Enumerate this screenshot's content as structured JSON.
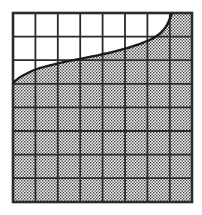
{
  "figure": {
    "canvas": {
      "width": 202,
      "height": 215,
      "background": "#ffffff"
    },
    "plot_box": {
      "x0": 13,
      "y0": 13,
      "x1": 192,
      "y1": 202
    },
    "grid": {
      "columns": 8,
      "rows": 8,
      "line_color": "#2b2b2b",
      "inner_line_width": 1.8,
      "border_line_width": 2.6,
      "x_lines": [
        13,
        35.4,
        57.8,
        80.2,
        102.6,
        125.0,
        147.4,
        169.8,
        192
      ],
      "y_lines": [
        13,
        36.6,
        60.2,
        83.8,
        107.4,
        131.0,
        154.6,
        178.2,
        202
      ]
    },
    "curve": {
      "name": "boundary-curve",
      "color": "#1a1a1a",
      "line_width": 2.4,
      "shape": "increasing-concave",
      "start_point": [
        13,
        83
      ],
      "end_point": [
        172,
        13
      ],
      "points": [
        [
          13,
          83.0
        ],
        [
          22,
          76.0
        ],
        [
          33,
          70.5
        ],
        [
          45,
          66.6
        ],
        [
          58,
          63.4
        ],
        [
          72,
          60.4
        ],
        [
          86,
          57.6
        ],
        [
          100,
          54.8
        ],
        [
          114,
          51.6
        ],
        [
          128,
          47.8
        ],
        [
          142,
          43.2
        ],
        [
          152,
          38.8
        ],
        [
          161,
          32.6
        ],
        [
          167,
          25.0
        ],
        [
          172,
          13.0
        ]
      ]
    },
    "shaded_region": {
      "name": "area-under-curve",
      "description": "Region bounded below by the bottom edge, right by the right edge, above by the curve, and left by the left edge below the curve start",
      "fill_style": "stipple-dots",
      "dot_color": "#3d3d3d",
      "dot_background": "#f2f2f2",
      "dot_spacing": 3,
      "dot_size": 1.35
    },
    "unshaded_region": {
      "name": "area-above-curve",
      "fill": "#ffffff"
    }
  }
}
